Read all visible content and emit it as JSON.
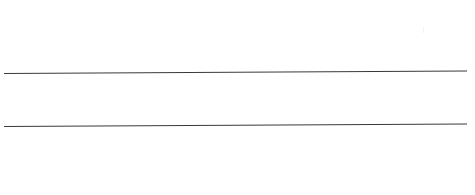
{
  "document": {
    "type": "blank ruled form",
    "lines": [
      {
        "label": "line-1",
        "value": ""
      },
      {
        "label": "line-2",
        "value": ""
      }
    ],
    "line_color": "#3a3a3a",
    "background": "#ffffff"
  }
}
